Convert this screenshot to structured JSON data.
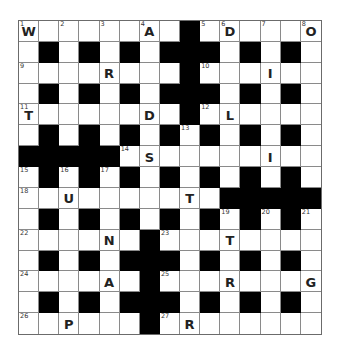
{
  "puzzle": {
    "rows": 15,
    "cols": 15,
    "colors": {
      "block": "#000000",
      "cell": "#ffffff",
      "line": "#8a8a8a",
      "text": "#222222"
    },
    "layout": [
      "########.######",
      "#.#.#.#...#.#.#",
      "########.######",
      "#.#.#.#...#.#.#",
      "########.######",
      "#.#.#.#.#.#.#.#",
      ".....##########",
      "#.#.#.#.#.#.#.#",
      "##########.....",
      "#.#.#.#.#.#.#.#",
      "######.########",
      "#.#.#...#.#.#.#",
      "######.########",
      "#.#.#...#.#.#.#",
      "######.########"
    ],
    "numbers": [
      {
        "r": 0,
        "c": 0,
        "n": "1"
      },
      {
        "r": 0,
        "c": 2,
        "n": "2"
      },
      {
        "r": 0,
        "c": 4,
        "n": "3"
      },
      {
        "r": 0,
        "c": 6,
        "n": "4"
      },
      {
        "r": 0,
        "c": 9,
        "n": "5"
      },
      {
        "r": 0,
        "c": 10,
        "n": "6"
      },
      {
        "r": 0,
        "c": 12,
        "n": "7"
      },
      {
        "r": 0,
        "c": 14,
        "n": "8"
      },
      {
        "r": 2,
        "c": 0,
        "n": "9"
      },
      {
        "r": 2,
        "c": 9,
        "n": "10"
      },
      {
        "r": 4,
        "c": 0,
        "n": "11"
      },
      {
        "r": 4,
        "c": 9,
        "n": "12"
      },
      {
        "r": 5,
        "c": 8,
        "n": "13"
      },
      {
        "r": 6,
        "c": 5,
        "n": "14"
      },
      {
        "r": 7,
        "c": 0,
        "n": "15"
      },
      {
        "r": 7,
        "c": 2,
        "n": "16"
      },
      {
        "r": 7,
        "c": 4,
        "n": "17"
      },
      {
        "r": 8,
        "c": 0,
        "n": "18"
      },
      {
        "r": 9,
        "c": 10,
        "n": "19"
      },
      {
        "r": 9,
        "c": 12,
        "n": "20"
      },
      {
        "r": 9,
        "c": 14,
        "n": "21"
      },
      {
        "r": 10,
        "c": 0,
        "n": "22"
      },
      {
        "r": 10,
        "c": 7,
        "n": "23"
      },
      {
        "r": 12,
        "c": 0,
        "n": "24"
      },
      {
        "r": 12,
        "c": 7,
        "n": "25"
      },
      {
        "r": 14,
        "c": 0,
        "n": "26"
      },
      {
        "r": 14,
        "c": 7,
        "n": "27"
      }
    ],
    "letters": [
      {
        "r": 0,
        "c": 0,
        "ch": "W"
      },
      {
        "r": 0,
        "c": 6,
        "ch": "A"
      },
      {
        "r": 0,
        "c": 10,
        "ch": "D"
      },
      {
        "r": 0,
        "c": 14,
        "ch": "O"
      },
      {
        "r": 2,
        "c": 4,
        "ch": "R"
      },
      {
        "r": 2,
        "c": 12,
        "ch": "I"
      },
      {
        "r": 4,
        "c": 0,
        "ch": "T"
      },
      {
        "r": 4,
        "c": 6,
        "ch": "D"
      },
      {
        "r": 4,
        "c": 10,
        "ch": "L"
      },
      {
        "r": 6,
        "c": 6,
        "ch": "S"
      },
      {
        "r": 6,
        "c": 12,
        "ch": "I"
      },
      {
        "r": 8,
        "c": 2,
        "ch": "U"
      },
      {
        "r": 8,
        "c": 8,
        "ch": "T"
      },
      {
        "r": 10,
        "c": 4,
        "ch": "N"
      },
      {
        "r": 10,
        "c": 10,
        "ch": "T"
      },
      {
        "r": 12,
        "c": 4,
        "ch": "A"
      },
      {
        "r": 12,
        "c": 10,
        "ch": "R"
      },
      {
        "r": 12,
        "c": 14,
        "ch": "G"
      },
      {
        "r": 14,
        "c": 2,
        "ch": "P"
      },
      {
        "r": 14,
        "c": 8,
        "ch": "R"
      }
    ]
  }
}
